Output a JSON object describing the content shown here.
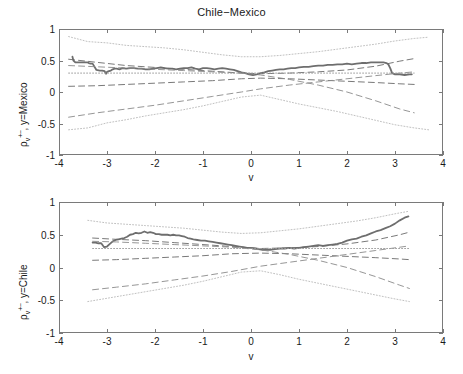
{
  "figure": {
    "title": "Chile−Mexico",
    "width": 463,
    "height": 374
  },
  "axis": {
    "x_name": "v",
    "x_ticks": [
      "-4",
      "-3",
      "-2",
      "-1",
      "0",
      "1",
      "2",
      "3",
      "4"
    ],
    "y_ticks": [
      "1",
      "0.5",
      "0",
      "-0.5",
      "-1"
    ],
    "y_title_top_rho": "ρ",
    "y_title_top_sub": "v",
    "y_title_top_sup": "+−",
    "y_title_top_tail": ", y=Mexico",
    "y_title_bottom_rho": "ρ",
    "y_title_bottom_sub": "v",
    "y_title_bottom_sup": "+−",
    "y_title_bottom_tail": ", y=Chile"
  },
  "colors": {
    "empirical": "#6e6e6e",
    "dashed_band": "#6a6a6a",
    "dotted_band": "#b9b9b9",
    "reference": "#9a9a9a",
    "frame": "#7a7a7a"
  },
  "chart_data": [
    {
      "type": "line",
      "panel": "top",
      "title": "Chile−Mexico",
      "xlabel": "v",
      "ylabel": "rho_v^{+-}, y=Mexico",
      "xlim": [
        -4,
        4
      ],
      "ylim": [
        -1,
        1
      ],
      "grid": false,
      "legend": "none",
      "series": [
        {
          "name": "empirical",
          "style": "solid",
          "width": 1.8,
          "color": "#6e6e6e",
          "x": [
            -3.72,
            -3.7,
            -3.66,
            -3.6,
            -3.55,
            -3.5,
            -3.45,
            -3.4,
            -3.38,
            -3.34,
            -3.3,
            -3.22,
            -3.15,
            -3.1,
            -3.05,
            -3.02,
            -3.0,
            -2.96,
            -2.92,
            -2.88,
            -2.84,
            -2.8,
            -2.74,
            -2.68,
            -2.6,
            -2.52,
            -2.44,
            -2.36,
            -2.28,
            -2.2,
            -2.12,
            -2.04,
            -1.96,
            -1.88,
            -1.8,
            -1.72,
            -1.64,
            -1.56,
            -1.48,
            -1.4,
            -1.32,
            -1.24,
            -1.16,
            -1.08,
            -1.0,
            -0.92,
            -0.84,
            -0.76,
            -0.68,
            -0.6,
            -0.52,
            -0.44,
            -0.36,
            -0.28,
            -0.2,
            -0.12,
            -0.04,
            0.04,
            0.12,
            0.2,
            0.28,
            0.36,
            0.44,
            0.52,
            0.6,
            0.68,
            0.76,
            0.84,
            0.92,
            1.0,
            1.1,
            1.2,
            1.3,
            1.4,
            1.5,
            1.6,
            1.7,
            1.8,
            1.9,
            2.0,
            2.1,
            2.2,
            2.3,
            2.4,
            2.5,
            2.6,
            2.7,
            2.76,
            2.82,
            2.86,
            2.9,
            2.94,
            3.0,
            3.1,
            3.2,
            3.3,
            3.35
          ],
          "y": [
            0.56,
            0.5,
            0.47,
            0.47,
            0.47,
            0.47,
            0.47,
            0.47,
            0.46,
            0.45,
            0.45,
            0.35,
            0.34,
            0.34,
            0.33,
            0.29,
            0.32,
            0.33,
            0.34,
            0.36,
            0.37,
            0.37,
            0.36,
            0.38,
            0.37,
            0.38,
            0.38,
            0.37,
            0.37,
            0.36,
            0.36,
            0.37,
            0.38,
            0.39,
            0.38,
            0.37,
            0.37,
            0.36,
            0.37,
            0.38,
            0.38,
            0.39,
            0.37,
            0.36,
            0.38,
            0.38,
            0.37,
            0.36,
            0.37,
            0.38,
            0.37,
            0.36,
            0.35,
            0.33,
            0.31,
            0.3,
            0.28,
            0.27,
            0.28,
            0.3,
            0.31,
            0.33,
            0.34,
            0.35,
            0.36,
            0.36,
            0.37,
            0.38,
            0.38,
            0.39,
            0.4,
            0.4,
            0.41,
            0.42,
            0.42,
            0.43,
            0.43,
            0.44,
            0.44,
            0.45,
            0.44,
            0.45,
            0.46,
            0.46,
            0.47,
            0.47,
            0.47,
            0.47,
            0.46,
            0.44,
            0.38,
            0.3,
            0.28,
            0.28,
            0.27,
            0.28,
            0.28,
            0.29
          ]
        },
        {
          "name": "dotted_upper",
          "style": "dotted",
          "color": "#b9b9b9",
          "x": [
            -3.8,
            -3.4,
            -3.0,
            -2.6,
            -2.2,
            -1.8,
            -1.4,
            -1.0,
            -0.6,
            -0.2,
            0.2,
            0.6,
            1.0,
            1.4,
            1.8,
            2.2,
            2.6,
            3.0,
            3.4,
            3.7
          ],
          "y": [
            0.88,
            0.8,
            0.78,
            0.74,
            0.72,
            0.7,
            0.67,
            0.63,
            0.59,
            0.56,
            0.56,
            0.58,
            0.61,
            0.64,
            0.68,
            0.72,
            0.76,
            0.81,
            0.85,
            0.87
          ]
        },
        {
          "name": "dotted_lower",
          "style": "dotted",
          "color": "#b9b9b9",
          "x": [
            -3.8,
            -3.4,
            -3.0,
            -2.6,
            -2.2,
            -1.8,
            -1.4,
            -1.0,
            -0.6,
            -0.2,
            0.2,
            0.6,
            1.0,
            1.4,
            1.8,
            2.2,
            2.6,
            3.0,
            3.4,
            3.7
          ],
          "y": [
            -0.6,
            -0.57,
            -0.49,
            -0.44,
            -0.38,
            -0.33,
            -0.28,
            -0.22,
            -0.15,
            -0.08,
            -0.05,
            -0.12,
            -0.19,
            -0.25,
            -0.31,
            -0.38,
            -0.45,
            -0.52,
            -0.57,
            -0.6
          ]
        },
        {
          "name": "dashed_upper",
          "style": "dashed",
          "color": "#6a6a6a",
          "x": [
            -3.8,
            -3.2,
            -2.6,
            -2.0,
            -1.4,
            -0.8,
            -0.2,
            0.2,
            0.8,
            1.4,
            2.0,
            2.6,
            3.1,
            3.4
          ],
          "y": [
            0.52,
            0.47,
            0.42,
            0.39,
            0.36,
            0.33,
            0.3,
            0.29,
            0.3,
            0.32,
            0.35,
            0.41,
            0.49,
            0.53
          ]
        },
        {
          "name": "dashed_lower",
          "style": "dashed",
          "color": "#6a6a6a",
          "x": [
            -3.8,
            -3.2,
            -2.6,
            -2.0,
            -1.4,
            -0.8,
            -0.2,
            0.2,
            0.8,
            1.4,
            2.0,
            2.6,
            3.1,
            3.4
          ],
          "y": [
            0.09,
            0.1,
            0.12,
            0.14,
            0.16,
            0.18,
            0.21,
            0.22,
            0.21,
            0.19,
            0.17,
            0.15,
            0.13,
            0.12
          ]
        },
        {
          "name": "dashed_cross_rising",
          "style": "dashed",
          "color": "#8a8a8a",
          "x": [
            -3.8,
            -3.2,
            -2.6,
            -2.0,
            -1.4,
            -0.8,
            -0.2,
            0.2,
            0.8,
            1.4,
            2.0,
            2.6,
            3.1,
            3.4
          ],
          "y": [
            -0.4,
            -0.33,
            -0.27,
            -0.21,
            -0.14,
            -0.07,
            0.0,
            0.05,
            0.11,
            0.16,
            0.21,
            0.26,
            0.3,
            0.32
          ]
        },
        {
          "name": "dashed_cross_falling",
          "style": "dashed",
          "color": "#8a8a8a",
          "x": [
            -3.8,
            -3.2,
            -2.6,
            -2.0,
            -1.4,
            -0.8,
            -0.2,
            0.2,
            0.8,
            1.4,
            2.0,
            2.6,
            3.1,
            3.4
          ],
          "y": [
            0.42,
            0.4,
            0.38,
            0.36,
            0.34,
            0.32,
            0.3,
            0.27,
            0.2,
            0.11,
            0.0,
            -0.14,
            -0.27,
            -0.33
          ]
        },
        {
          "name": "reference_level",
          "style": "dotted",
          "color": "#9a9a9a",
          "x": [
            -3.8,
            3.4
          ],
          "y": [
            0.3,
            0.3
          ]
        }
      ]
    },
    {
      "type": "line",
      "panel": "bottom",
      "xlabel": "v",
      "ylabel": "rho_v^{+-}, y=Chile",
      "xlim": [
        -4,
        4
      ],
      "ylim": [
        -1,
        1
      ],
      "grid": false,
      "legend": "none",
      "series": [
        {
          "name": "empirical",
          "style": "solid",
          "width": 1.8,
          "color": "#6e6e6e",
          "x": [
            -3.3,
            -3.24,
            -3.18,
            -3.12,
            -3.06,
            -3.0,
            -2.94,
            -2.88,
            -2.82,
            -2.76,
            -2.7,
            -2.64,
            -2.58,
            -2.52,
            -2.46,
            -2.4,
            -2.34,
            -2.28,
            -2.22,
            -2.16,
            -2.1,
            -2.04,
            -1.98,
            -1.92,
            -1.86,
            -1.8,
            -1.74,
            -1.68,
            -1.62,
            -1.56,
            -1.5,
            -1.44,
            -1.38,
            -1.32,
            -1.26,
            -1.2,
            -1.12,
            -1.04,
            -0.96,
            -0.88,
            -0.8,
            -0.72,
            -0.64,
            -0.56,
            -0.48,
            -0.4,
            -0.32,
            -0.24,
            -0.16,
            -0.08,
            0.0,
            0.08,
            0.16,
            0.24,
            0.32,
            0.4,
            0.5,
            0.6,
            0.7,
            0.8,
            0.9,
            1.0,
            1.1,
            1.2,
            1.3,
            1.4,
            1.5,
            1.6,
            1.7,
            1.8,
            1.9,
            2.0,
            2.1,
            2.2,
            2.3,
            2.4,
            2.5,
            2.6,
            2.7,
            2.8,
            2.9,
            3.0,
            3.1,
            3.2,
            3.28
          ],
          "y": [
            0.38,
            0.38,
            0.37,
            0.37,
            0.31,
            0.32,
            0.36,
            0.4,
            0.42,
            0.43,
            0.44,
            0.45,
            0.47,
            0.5,
            0.51,
            0.53,
            0.52,
            0.53,
            0.55,
            0.53,
            0.54,
            0.53,
            0.51,
            0.51,
            0.5,
            0.5,
            0.5,
            0.49,
            0.5,
            0.49,
            0.49,
            0.48,
            0.47,
            0.45,
            0.44,
            0.43,
            0.42,
            0.41,
            0.41,
            0.4,
            0.39,
            0.38,
            0.37,
            0.36,
            0.35,
            0.34,
            0.33,
            0.32,
            0.31,
            0.3,
            0.3,
            0.29,
            0.28,
            0.27,
            0.27,
            0.27,
            0.28,
            0.29,
            0.29,
            0.3,
            0.29,
            0.3,
            0.31,
            0.32,
            0.33,
            0.34,
            0.33,
            0.34,
            0.35,
            0.36,
            0.38,
            0.41,
            0.43,
            0.44,
            0.47,
            0.49,
            0.52,
            0.55,
            0.57,
            0.6,
            0.63,
            0.67,
            0.72,
            0.76,
            0.78,
            0.78
          ]
        },
        {
          "name": "dotted_upper",
          "style": "dotted",
          "color": "#b9b9b9",
          "x": [
            -3.4,
            -3.0,
            -2.6,
            -2.2,
            -1.8,
            -1.4,
            -1.0,
            -0.6,
            -0.2,
            0.2,
            0.6,
            1.0,
            1.4,
            1.8,
            2.2,
            2.6,
            3.0,
            3.3
          ],
          "y": [
            0.72,
            0.68,
            0.66,
            0.64,
            0.62,
            0.6,
            0.57,
            0.54,
            0.52,
            0.53,
            0.56,
            0.59,
            0.63,
            0.67,
            0.71,
            0.76,
            0.82,
            0.86
          ]
        },
        {
          "name": "dotted_lower",
          "style": "dotted",
          "color": "#b9b9b9",
          "x": [
            -3.4,
            -3.0,
            -2.6,
            -2.2,
            -1.8,
            -1.4,
            -1.0,
            -0.6,
            -0.2,
            0.2,
            0.6,
            1.0,
            1.4,
            1.8,
            2.2,
            2.6,
            3.0,
            3.3
          ],
          "y": [
            -0.52,
            -0.47,
            -0.42,
            -0.37,
            -0.32,
            -0.27,
            -0.21,
            -0.14,
            -0.07,
            -0.05,
            -0.11,
            -0.18,
            -0.24,
            -0.3,
            -0.36,
            -0.42,
            -0.48,
            -0.52
          ]
        },
        {
          "name": "dashed_upper",
          "style": "dashed",
          "color": "#6a6a6a",
          "x": [
            -3.3,
            -2.8,
            -2.2,
            -1.6,
            -1.0,
            -0.4,
            0.2,
            0.8,
            1.4,
            2.0,
            2.6,
            3.1,
            3.3
          ],
          "y": [
            0.45,
            0.43,
            0.41,
            0.38,
            0.35,
            0.32,
            0.29,
            0.3,
            0.32,
            0.36,
            0.42,
            0.5,
            0.54
          ]
        },
        {
          "name": "dashed_lower",
          "style": "dashed",
          "color": "#6a6a6a",
          "x": [
            -3.3,
            -2.8,
            -2.2,
            -1.6,
            -1.0,
            -0.4,
            0.2,
            0.8,
            1.4,
            2.0,
            2.6,
            3.1,
            3.3
          ],
          "y": [
            0.11,
            0.12,
            0.14,
            0.16,
            0.18,
            0.21,
            0.22,
            0.21,
            0.19,
            0.17,
            0.15,
            0.13,
            0.12
          ]
        },
        {
          "name": "dashed_cross_rising",
          "style": "dashed",
          "color": "#8a8a8a",
          "x": [
            -3.3,
            -2.8,
            -2.2,
            -1.6,
            -1.0,
            -0.4,
            0.2,
            0.8,
            1.4,
            2.0,
            2.6,
            3.1,
            3.3
          ],
          "y": [
            -0.34,
            -0.3,
            -0.25,
            -0.19,
            -0.13,
            -0.06,
            0.02,
            0.08,
            0.14,
            0.2,
            0.26,
            0.31,
            0.33
          ]
        },
        {
          "name": "dashed_cross_falling",
          "style": "dashed",
          "color": "#8a8a8a",
          "x": [
            -3.3,
            -2.8,
            -2.2,
            -1.6,
            -1.0,
            -0.4,
            0.2,
            0.8,
            1.4,
            2.0,
            2.6,
            3.1,
            3.3
          ],
          "y": [
            0.4,
            0.39,
            0.37,
            0.35,
            0.33,
            0.31,
            0.27,
            0.2,
            0.11,
            0.0,
            -0.14,
            -0.27,
            -0.32
          ]
        },
        {
          "name": "reference_level",
          "style": "dotted",
          "color": "#9a9a9a",
          "x": [
            -3.3,
            3.3
          ],
          "y": [
            0.29,
            0.29
          ]
        }
      ]
    }
  ]
}
